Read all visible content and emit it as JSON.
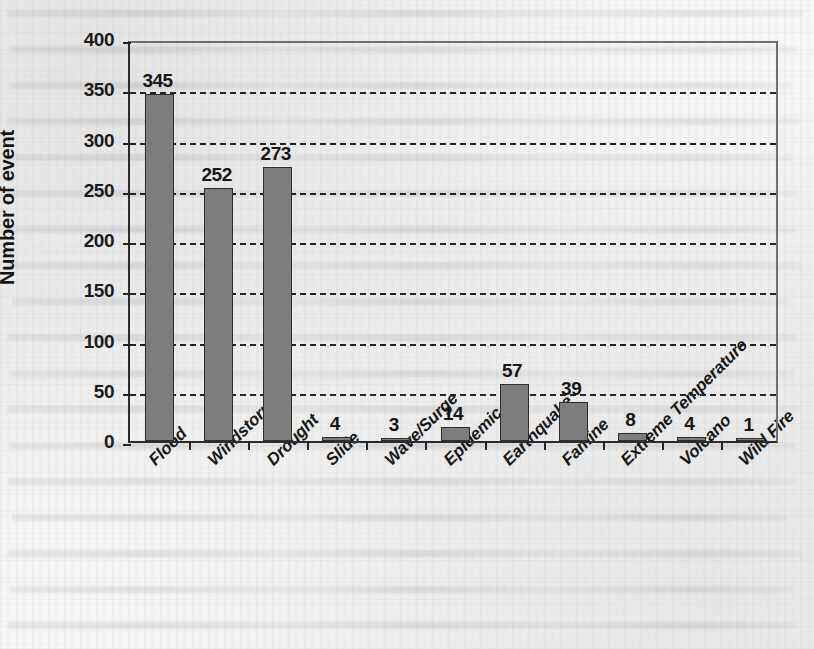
{
  "chart_data": {
    "type": "bar",
    "title": "",
    "xlabel": "",
    "ylabel": "Number of event",
    "ylim": [
      0,
      400
    ],
    "ytick_step": 50,
    "yticks": [
      400,
      350,
      300,
      250,
      200,
      150,
      100,
      50,
      0
    ],
    "grid": "horizontal-dashed",
    "legend": "none",
    "bar_color": "#7d7d7d",
    "bar_border_color": "#2e2e2e",
    "axis_color": "#232323",
    "categories": [
      "Flood",
      "Windstorm",
      "Drought",
      "Slide",
      "Wave/Surge",
      "Epidemic",
      "Earthquake",
      "Famine",
      "Extreme Temperature",
      "Volcano",
      "Wild Fire"
    ],
    "values": [
      345,
      252,
      273,
      4,
      3,
      14,
      57,
      39,
      8,
      4,
      1
    ],
    "data_labels": [
      "345",
      "252",
      "273",
      "4",
      "3",
      "14",
      "57",
      "39",
      "8",
      "4",
      "1"
    ]
  }
}
